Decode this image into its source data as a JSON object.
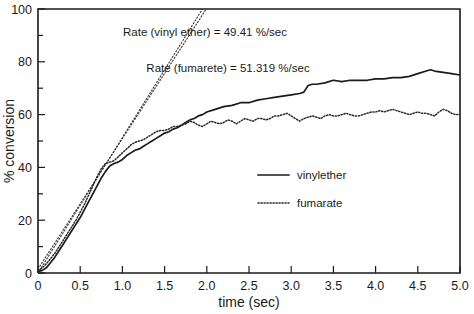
{
  "chart_data": {
    "type": "line",
    "title": "",
    "xlabel": "time (sec)",
    "ylabel": "% conversion",
    "xlim": [
      0,
      5.0
    ],
    "ylim": [
      0,
      100
    ],
    "grid": false,
    "legend_position": "center-right",
    "xticks": [
      "0",
      "0.5",
      "1.0",
      "1.5",
      "2.0",
      "2.5",
      "3.0",
      "3.5",
      "4.0",
      "4.5",
      "5.0"
    ],
    "xtick_values": [
      0,
      0.5,
      1.0,
      1.5,
      2.0,
      2.5,
      3.0,
      3.5,
      4.0,
      4.5,
      5.0
    ],
    "yticks": [
      "0",
      "20",
      "40",
      "60",
      "80",
      "100"
    ],
    "ytick_values": [
      0,
      20,
      40,
      60,
      80,
      100
    ],
    "yminor_values": [
      10,
      30,
      50,
      70,
      90
    ],
    "series": [
      {
        "name": "vinylether",
        "style": "solid",
        "x": [
          0.0,
          0.05,
          0.1,
          0.15,
          0.2,
          0.25,
          0.3,
          0.35,
          0.4,
          0.45,
          0.5,
          0.55,
          0.6,
          0.65,
          0.7,
          0.75,
          0.8,
          0.85,
          0.9,
          0.95,
          1.0,
          1.05,
          1.1,
          1.15,
          1.2,
          1.25,
          1.3,
          1.35,
          1.4,
          1.45,
          1.5,
          1.55,
          1.6,
          1.65,
          1.7,
          1.75,
          1.8,
          1.85,
          1.9,
          1.95,
          2.0,
          2.1,
          2.2,
          2.3,
          2.4,
          2.5,
          2.6,
          2.7,
          2.8,
          2.9,
          3.0,
          3.1,
          3.15,
          3.2,
          3.25,
          3.3,
          3.4,
          3.5,
          3.6,
          3.7,
          3.8,
          3.9,
          4.0,
          4.1,
          4.2,
          4.3,
          4.4,
          4.5,
          4.6,
          4.65,
          4.7,
          4.8,
          4.9,
          5.0
        ],
        "y": [
          0.5,
          1.0,
          2.0,
          4.0,
          6.0,
          8.5,
          11.0,
          13.5,
          16.0,
          18.5,
          21.0,
          24.0,
          27.0,
          30.0,
          33.0,
          36.0,
          38.5,
          40.5,
          41.5,
          42.0,
          43.0,
          44.5,
          45.5,
          46.5,
          47.0,
          48.0,
          49.0,
          50.0,
          51.0,
          52.0,
          53.0,
          53.5,
          54.5,
          55.0,
          56.0,
          57.0,
          58.0,
          58.5,
          59.5,
          60.0,
          61.0,
          62.0,
          63.0,
          63.5,
          64.5,
          64.5,
          65.5,
          66.0,
          66.5,
          67.0,
          67.5,
          68.0,
          68.5,
          71.0,
          71.5,
          71.5,
          72.0,
          73.0,
          72.5,
          73.0,
          73.0,
          73.0,
          73.5,
          73.5,
          74.0,
          74.0,
          74.5,
          75.5,
          76.5,
          77.0,
          76.5,
          76.0,
          75.5,
          75.0
        ]
      },
      {
        "name": "fumarate",
        "style": "dotted",
        "x": [
          0.0,
          0.05,
          0.1,
          0.15,
          0.2,
          0.25,
          0.3,
          0.35,
          0.4,
          0.45,
          0.5,
          0.55,
          0.6,
          0.65,
          0.7,
          0.75,
          0.8,
          0.85,
          0.9,
          0.95,
          1.0,
          1.05,
          1.1,
          1.15,
          1.2,
          1.25,
          1.3,
          1.35,
          1.4,
          1.45,
          1.5,
          1.55,
          1.6,
          1.65,
          1.7,
          1.75,
          1.8,
          1.85,
          1.9,
          1.95,
          2.0,
          2.05,
          2.1,
          2.15,
          2.2,
          2.25,
          2.3,
          2.35,
          2.4,
          2.45,
          2.5,
          2.55,
          2.6,
          2.65,
          2.7,
          2.75,
          2.8,
          2.85,
          2.9,
          2.95,
          3.0,
          3.05,
          3.1,
          3.15,
          3.2,
          3.25,
          3.3,
          3.35,
          3.4,
          3.45,
          3.5,
          3.55,
          3.6,
          3.65,
          3.7,
          3.75,
          3.8,
          3.85,
          3.9,
          3.95,
          4.0,
          4.05,
          4.1,
          4.15,
          4.2,
          4.25,
          4.3,
          4.35,
          4.4,
          4.45,
          4.5,
          4.55,
          4.6,
          4.65,
          4.7,
          4.75,
          4.8,
          4.85,
          4.9,
          4.95,
          5.0
        ],
        "y": [
          1.0,
          2.0,
          3.5,
          5.5,
          7.5,
          10.0,
          12.5,
          15.0,
          17.5,
          20.0,
          23.0,
          26.0,
          29.5,
          33.0,
          36.5,
          39.5,
          41.5,
          42.0,
          42.5,
          44.0,
          45.5,
          47.0,
          48.5,
          49.5,
          50.0,
          50.5,
          51.5,
          52.5,
          53.5,
          54.0,
          54.0,
          54.5,
          55.5,
          55.5,
          56.0,
          56.5,
          57.5,
          57.0,
          56.0,
          55.5,
          56.5,
          57.5,
          57.0,
          56.5,
          57.0,
          58.0,
          57.5,
          56.5,
          57.5,
          58.5,
          58.0,
          57.5,
          58.5,
          58.5,
          58.0,
          58.5,
          59.5,
          59.5,
          60.0,
          60.5,
          59.5,
          58.5,
          57.5,
          58.5,
          59.0,
          59.5,
          59.0,
          58.5,
          59.5,
          60.0,
          59.5,
          59.5,
          60.0,
          60.5,
          60.0,
          59.5,
          59.5,
          60.0,
          60.5,
          61.0,
          61.0,
          61.5,
          61.0,
          61.5,
          62.0,
          61.5,
          61.0,
          60.5,
          60.0,
          60.5,
          61.0,
          60.5,
          60.5,
          60.0,
          59.5,
          61.0,
          62.0,
          61.5,
          60.5,
          60.0,
          60.0
        ]
      }
    ],
    "fit_lines": [
      {
        "name": "vinyl-ether-rate-fit",
        "slope": 49.41,
        "intercept": 1.5,
        "x_range": [
          0.0,
          2.0
        ],
        "style": "dotted"
      },
      {
        "name": "fumarate-rate-fit",
        "slope": 51.319,
        "intercept": 0.0,
        "x_range": [
          0.0,
          1.95
        ],
        "style": "dotted"
      }
    ],
    "annotations": [
      {
        "text": "Rate (vinyl ether) = 49.41 %/sec",
        "x_px": 205,
        "y_px": 36
      },
      {
        "text": "Rate (fumarete) = 51.319 %/sec",
        "x_px": 228,
        "y_px": 72
      }
    ],
    "legend": [
      {
        "label": "vinylether",
        "style": "solid"
      },
      {
        "label": "fumarate",
        "style": "dotted"
      }
    ]
  }
}
